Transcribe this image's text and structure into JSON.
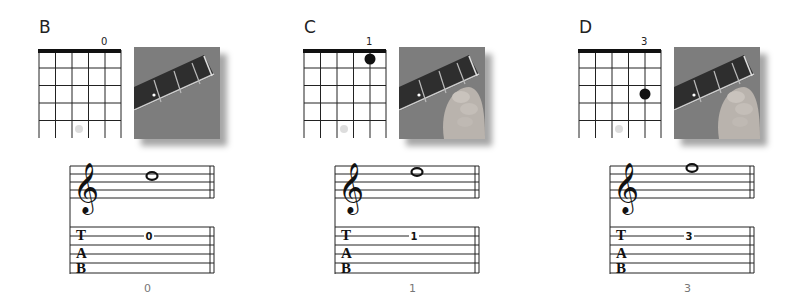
{
  "panels": [
    {
      "note": "B",
      "fret": "0",
      "tab_fret": "0",
      "bottom": "0",
      "dot_fret": 0
    },
    {
      "note": "C",
      "fret": "1",
      "tab_fret": "1",
      "bottom": "1",
      "dot_fret": 1
    },
    {
      "note": "D",
      "fret": "3",
      "tab_fret": "3",
      "bottom": "3",
      "dot_fret": 3
    }
  ],
  "tab_letters": {
    "t": "T",
    "a": "A",
    "b": "B"
  }
}
